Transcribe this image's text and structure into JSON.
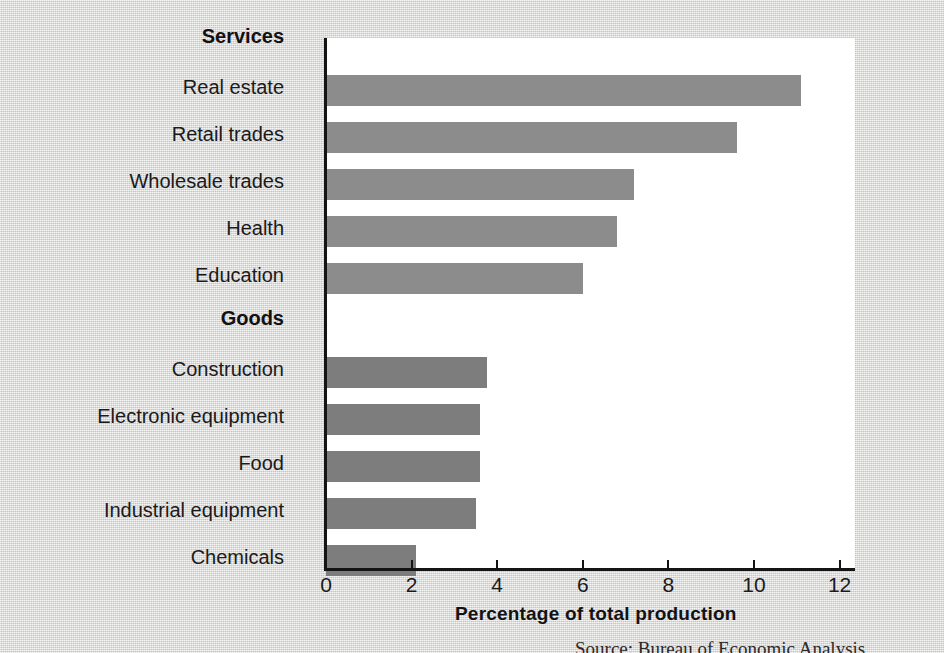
{
  "chart_data": {
    "type": "bar",
    "orientation": "horizontal",
    "title": "",
    "xlabel": "Percentage of total production",
    "ylabel": "",
    "xlim": [
      0,
      12.4
    ],
    "xticks": [
      0,
      2,
      4,
      6,
      8,
      10,
      12
    ],
    "xtick_labels": [
      "0",
      "2",
      "4",
      "6",
      "8",
      "10",
      "12"
    ],
    "grid": false,
    "legend": "none",
    "groups": [
      {
        "name": "Services",
        "color": "#8c8c8c",
        "categories": [
          "Real estate",
          "Retail trades",
          "Wholesale trades",
          "Health",
          "Education"
        ],
        "values": [
          11.1,
          9.6,
          7.2,
          6.8,
          6.0
        ]
      },
      {
        "name": "Goods",
        "color": "#7d7d7d",
        "categories": [
          "Construction",
          "Electronic equipment",
          "Food",
          "Industrial equipment",
          "Chemicals"
        ],
        "values": [
          3.75,
          3.6,
          3.6,
          3.5,
          2.1
        ]
      }
    ],
    "categories": [
      "Real estate",
      "Retail trades",
      "Wholesale trades",
      "Health",
      "Education",
      "Construction",
      "Electronic equipment",
      "Food",
      "Industrial equipment",
      "Chemicals"
    ],
    "values": [
      11.1,
      9.6,
      7.2,
      6.8,
      6.0,
      3.75,
      3.6,
      3.6,
      3.5,
      2.1
    ]
  },
  "axis": {
    "x_title": "Percentage of total production",
    "ticks": [
      {
        "label": "0",
        "value": 0
      },
      {
        "label": "2",
        "value": 2
      },
      {
        "label": "4",
        "value": 4
      },
      {
        "label": "6",
        "value": 6
      },
      {
        "label": "8",
        "value": 8
      },
      {
        "label": "10",
        "value": 10
      },
      {
        "label": "12",
        "value": 12
      }
    ]
  },
  "rows": [
    {
      "kind": "group",
      "label": "Services"
    },
    {
      "kind": "bar",
      "label": "Real estate",
      "value": 11.1,
      "color": "#8c8c8c"
    },
    {
      "kind": "bar",
      "label": "Retail trades",
      "value": 9.6,
      "color": "#8c8c8c"
    },
    {
      "kind": "bar",
      "label": "Wholesale trades",
      "value": 7.2,
      "color": "#8c8c8c"
    },
    {
      "kind": "bar",
      "label": "Health",
      "value": 6.8,
      "color": "#8c8c8c"
    },
    {
      "kind": "bar",
      "label": "Education",
      "value": 6.0,
      "color": "#8c8c8c"
    },
    {
      "kind": "group",
      "label": "Goods"
    },
    {
      "kind": "bar",
      "label": "Construction",
      "value": 3.75,
      "color": "#7d7d7d"
    },
    {
      "kind": "bar",
      "label": "Electronic equipment",
      "value": 3.6,
      "color": "#7d7d7d"
    },
    {
      "kind": "bar",
      "label": "Food",
      "value": 3.6,
      "color": "#7d7d7d"
    },
    {
      "kind": "bar",
      "label": "Industrial equipment",
      "value": 3.5,
      "color": "#7d7d7d"
    },
    {
      "kind": "bar",
      "label": "Chemicals",
      "value": 2.1,
      "color": "#7d7d7d"
    }
  ],
  "source": {
    "text": "Source: Bureau of Economic Analysis"
  }
}
